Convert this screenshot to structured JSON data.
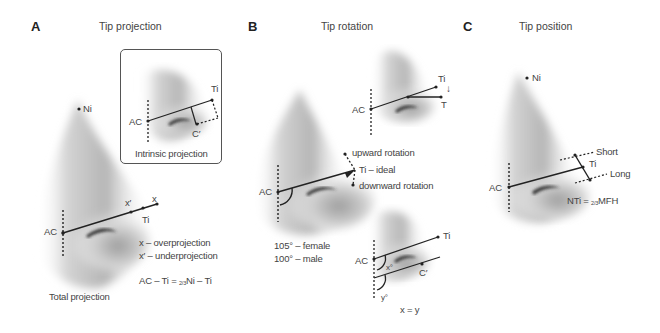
{
  "panels": [
    {
      "letter": "A",
      "title": "Tip projection",
      "labels": {
        "ni": "Ni",
        "ac": "AC",
        "ti": "Ti",
        "x": "x",
        "x_prime": "x′",
        "caption": "Total projection",
        "legend_x": "x – overprojection",
        "legend_x_prime": "x′ – underprojection",
        "formula_left": "AC – Ti = ",
        "formula_sub": "2/3",
        "formula_right": "Ni – Ti"
      },
      "inset": {
        "caption": "Intrinsic projection",
        "ac": "AC",
        "ti": "Ti",
        "c_prime": "C′"
      }
    },
    {
      "letter": "B",
      "title": "Tip rotation",
      "labels": {
        "ac": "AC",
        "upward": "upward rotation",
        "ideal": "Ti – ideal",
        "downward": "downward rotation",
        "female": "105° – female",
        "male": "100° – male"
      },
      "top_inset": {
        "ac": "AC",
        "ti": "Ti",
        "t": "T",
        "arrow": "down-arrow-icon"
      },
      "bottom_inset": {
        "ac": "AC",
        "ti": "Ti",
        "c_prime": "C′",
        "x_angle": "x°",
        "y_angle": "y°",
        "equation": "x = y"
      }
    },
    {
      "letter": "C",
      "title": "Tip position",
      "labels": {
        "ni": "Ni",
        "ac": "AC",
        "ti": "Ti",
        "short": "Short",
        "long": "Long",
        "formula_left": "NTi = ",
        "formula_sub": "2/3",
        "formula_right": "MFH"
      }
    }
  ],
  "colors": {
    "line": "#222222",
    "text": "#444444",
    "shade_dark": "#9a9a9a",
    "shade_light": "#ffffff",
    "nostril": "#333333"
  }
}
